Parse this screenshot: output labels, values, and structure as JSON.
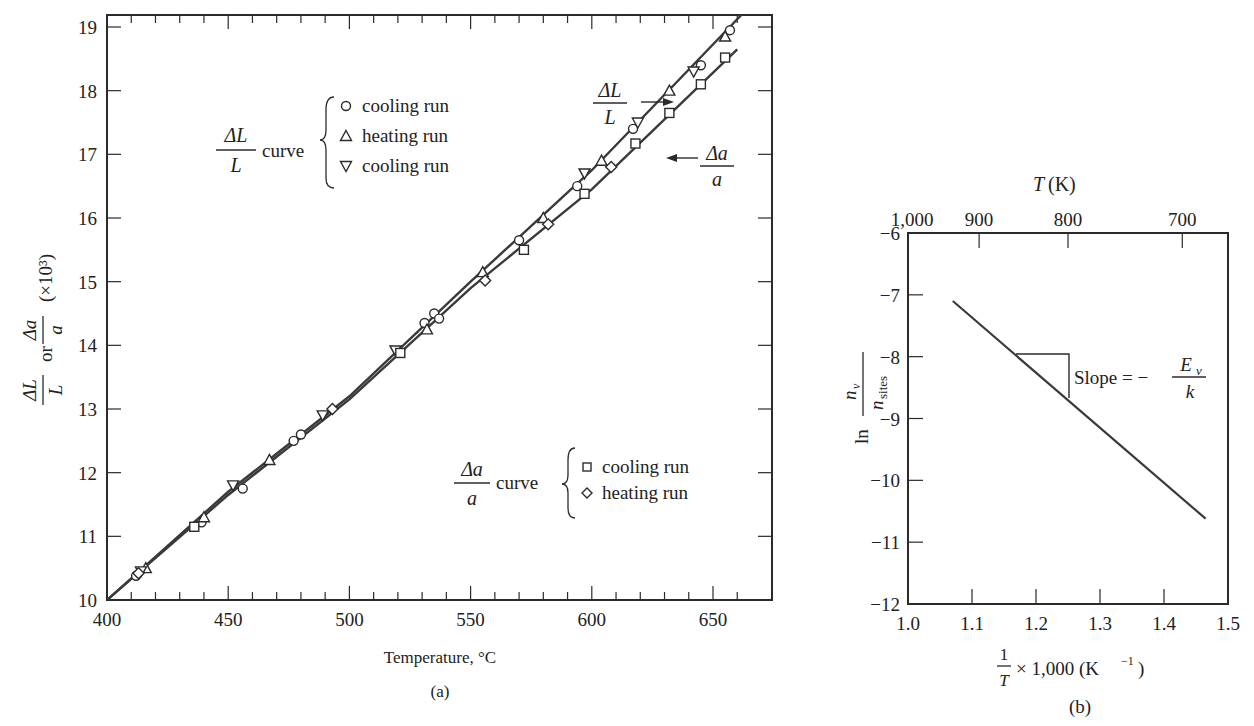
{
  "chart_data": [
    {
      "id": "a",
      "type": "scatter",
      "caption": "(a)",
      "xlabel": "Temperature, °C",
      "ylabel": "ΔL/L or Δa/a (×10³)",
      "ylabel_parts": {
        "frac1_num": "ΔL",
        "frac1_den": "L",
        "or": "or",
        "frac2_num": "Δa",
        "frac2_den": "a",
        "scale": "(×10³)"
      },
      "xlim": [
        400,
        665
      ],
      "ylim": [
        10,
        19.2
      ],
      "xticks": [
        400,
        450,
        500,
        550,
        600,
        650
      ],
      "yticks": [
        10,
        11,
        12,
        13,
        14,
        15,
        16,
        17,
        18,
        19
      ],
      "grid": false,
      "legend": {
        "dL": {
          "label_num": "ΔL",
          "label_den": "L",
          "word": "curve",
          "entries": [
            {
              "marker": "circle",
              "label": "cooling run"
            },
            {
              "marker": "triangle-up",
              "label": "heating run"
            },
            {
              "marker": "triangle-down",
              "label": "cooling run"
            }
          ]
        },
        "da": {
          "label_num": "Δa",
          "label_den": "a",
          "word": "curve",
          "entries": [
            {
              "marker": "square",
              "label": "cooling run"
            },
            {
              "marker": "diamond",
              "label": "heating run"
            }
          ]
        }
      },
      "annotations": [
        {
          "text_num": "ΔL",
          "text_den": "L",
          "arrow": "right"
        },
        {
          "text_num": "Δa",
          "text_den": "a",
          "arrow": "left"
        }
      ],
      "series": [
        {
          "name": "ΔL/L curve",
          "kind": "line",
          "x": [
            400,
            450,
            500,
            550,
            600,
            662
          ],
          "y": [
            10.0,
            11.7,
            13.2,
            15.0,
            16.75,
            19.2
          ]
        },
        {
          "name": "Δa/a curve",
          "kind": "line",
          "x": [
            400,
            450,
            500,
            550,
            600,
            660
          ],
          "y": [
            10.0,
            11.65,
            13.15,
            14.9,
            16.45,
            18.65
          ]
        },
        {
          "name": "ΔL/L cooling run (○)",
          "marker": "circle",
          "x": [
            412,
            439,
            456,
            477,
            480,
            531,
            535,
            537,
            570,
            594,
            617,
            645,
            657
          ],
          "y": [
            10.38,
            11.22,
            11.75,
            12.5,
            12.6,
            14.35,
            14.5,
            14.42,
            15.65,
            16.5,
            17.4,
            18.4,
            18.95
          ]
        },
        {
          "name": "ΔL/L heating run (△)",
          "marker": "triangle-up",
          "x": [
            416,
            440,
            467,
            532,
            555,
            580,
            604,
            632,
            655
          ],
          "y": [
            10.5,
            11.3,
            12.2,
            14.25,
            15.15,
            16.0,
            16.9,
            18.0,
            18.85
          ]
        },
        {
          "name": "ΔL/L cooling run (▽)",
          "marker": "triangle-down",
          "x": [
            414,
            452,
            489,
            519,
            597,
            619,
            642
          ],
          "y": [
            10.45,
            11.8,
            12.9,
            13.92,
            16.7,
            17.5,
            18.3
          ]
        },
        {
          "name": "Δa/a cooling run (□)",
          "marker": "square",
          "x": [
            436,
            521,
            572,
            597,
            618,
            632,
            645,
            655
          ],
          "y": [
            11.15,
            13.88,
            15.5,
            16.38,
            17.17,
            17.65,
            18.1,
            18.52
          ]
        },
        {
          "name": "Δa/a heating run (◇)",
          "marker": "diamond",
          "x": [
            413,
            493,
            556,
            582,
            608
          ],
          "y": [
            10.42,
            13.0,
            15.02,
            15.9,
            16.8
          ]
        }
      ]
    },
    {
      "id": "b",
      "type": "line",
      "caption": "(b)",
      "xlabel": "1/T × 1,000 (K⁻¹)",
      "xlabel_parts": {
        "num": "1",
        "den": "T",
        "rest": "× 1,000 (K",
        "exp": "−1",
        "close": ")"
      },
      "ylabel": "ln nv/nsites",
      "ylabel_parts": {
        "ln": "ln",
        "num": "n",
        "num_sub": "v",
        "den": "n",
        "den_sub": "sites"
      },
      "top_axis_label": "T (K)",
      "top_axis_label_parts": {
        "var": "T",
        "unit": "(K)"
      },
      "xlim": [
        1.0,
        1.5
      ],
      "ylim": [
        -12,
        -6
      ],
      "xticks": [
        1.0,
        1.1,
        1.2,
        1.3,
        1.4,
        1.5
      ],
      "xtick_labels": [
        "1.0",
        "1.1",
        "1.2",
        "1.3",
        "1.4",
        "1.5"
      ],
      "yticks": [
        -6,
        -7,
        -8,
        -9,
        -10,
        -11,
        -12
      ],
      "ytick_labels": [
        "−6",
        "−7",
        "−8",
        "−9",
        "−10",
        "−11",
        "−12"
      ],
      "top_ticks": [
        1000,
        900,
        800,
        700
      ],
      "top_tick_labels": [
        "1,000",
        "900",
        "800",
        "700"
      ],
      "grid": false,
      "annotation": {
        "text": "Slope = −",
        "num": "E",
        "num_sub": "v",
        "den": "k"
      },
      "series": [
        {
          "name": "ln(nv/nsites)",
          "x": [
            1.07,
            1.465
          ],
          "y": [
            -7.1,
            -10.62
          ]
        }
      ]
    }
  ]
}
